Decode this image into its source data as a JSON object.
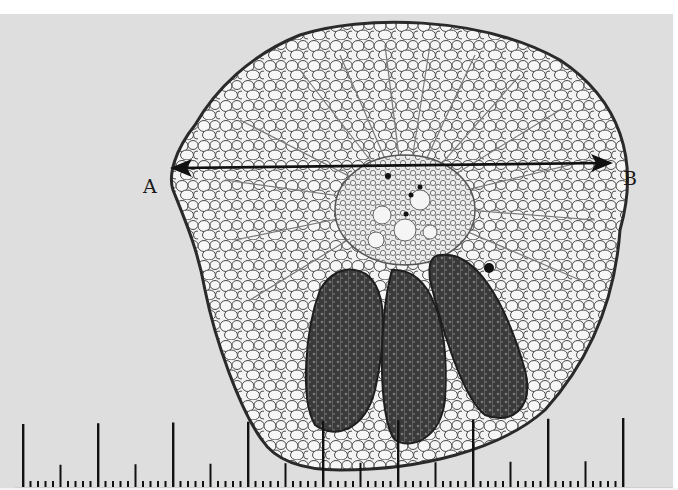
{
  "figure": {
    "background_color": "#dedede",
    "tissue_outline_color": "#2a2a2a",
    "vascular_bundle_color": "#3c3c3c"
  },
  "measurement": {
    "start_label": "A",
    "end_label": "B",
    "arrow": "double-headed",
    "arrow_color": "#111111"
  },
  "scale_ruler": {
    "major_tick_count": 9,
    "subdivisions_per_major": 10,
    "major_tick_spacing_px": 75,
    "tick_color": "#111111"
  }
}
